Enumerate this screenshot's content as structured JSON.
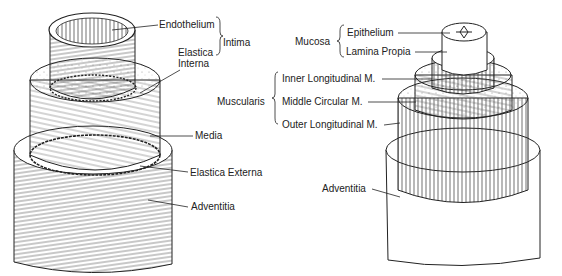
{
  "left_diagram": {
    "subject": "blood vessel (artery) wall layers",
    "labels": {
      "endothelium": "Endothelium",
      "intima": "Intima",
      "elastica_interna_1": "Elastica",
      "elastica_interna_2": "Interna",
      "media": "Media",
      "elastica_externa": "Elastica Externa",
      "adventitia": "Adventitia"
    }
  },
  "right_diagram": {
    "subject": "gastrointestinal tube wall layers",
    "labels": {
      "mucosa": "Mucosa",
      "epithelium": "Epithelium",
      "lamina_propia": "Lamina Propia",
      "muscularis": "Muscularis",
      "inner_longitudinal": "Inner Longitudinal M.",
      "middle_circular": "Middle Circular M.",
      "outer_longitudinal": "Outer Longitudinal M.",
      "adventitia": "Adventitia"
    }
  },
  "colors": {
    "ink": "#222222",
    "background": "#ffffff",
    "fill": "#ffffff",
    "shade": "#d8d8d8"
  }
}
